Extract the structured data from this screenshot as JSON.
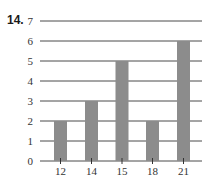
{
  "problem": {
    "number": "14."
  },
  "chart_data": {
    "type": "bar",
    "title": "",
    "xlabel": "",
    "ylabel": "",
    "categories": [
      "12",
      "14",
      "15",
      "18",
      "21"
    ],
    "values": [
      2,
      3,
      5,
      2,
      6
    ],
    "ylim": [
      0,
      7
    ],
    "yticks": [
      "0",
      "1",
      "2",
      "3",
      "4",
      "5",
      "6",
      "7"
    ],
    "grid": true,
    "legend": null,
    "bar_color": "#8c8c8c",
    "grid_color": "#4a4a4a"
  }
}
